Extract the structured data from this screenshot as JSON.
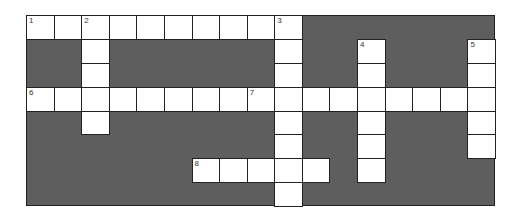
{
  "puzzle": {
    "cols": 17,
    "rows": 8,
    "colors": {
      "block": "#5e5e5e",
      "cell": "#ffffff",
      "border": "#222222"
    },
    "entries": [
      {
        "number": "1",
        "direction": "across",
        "row": 0,
        "col": 0,
        "length": 10
      },
      {
        "number": "2",
        "direction": "down",
        "row": 0,
        "col": 2,
        "length": 5
      },
      {
        "number": "3",
        "direction": "down",
        "row": 0,
        "col": 9,
        "length": 8
      },
      {
        "number": "4",
        "direction": "down",
        "row": 1,
        "col": 12,
        "length": 6
      },
      {
        "number": "5",
        "direction": "down",
        "row": 1,
        "col": 16,
        "length": 5
      },
      {
        "number": "6",
        "direction": "across",
        "row": 3,
        "col": 0,
        "length": 8
      },
      {
        "number": "7",
        "direction": "across",
        "row": 3,
        "col": 8,
        "length": 9
      },
      {
        "number": "8",
        "direction": "across",
        "row": 6,
        "col": 6,
        "length": 5
      }
    ]
  }
}
